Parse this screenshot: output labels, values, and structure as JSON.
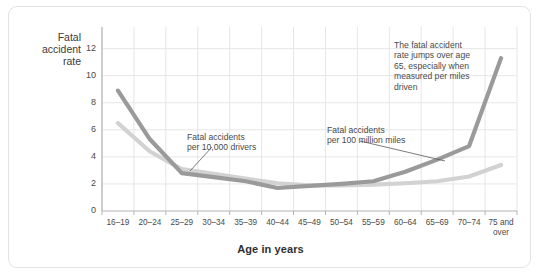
{
  "chart_data": {
    "type": "line",
    "title": "",
    "xlabel": "Age in years",
    "ylabel": "Fatal accident rate",
    "ylabel_lines": [
      "Fatal",
      "accident",
      "rate"
    ],
    "categories": [
      "16–19",
      "20–24",
      "25–29",
      "30–34",
      "35–39",
      "40–44",
      "45–49",
      "50–54",
      "55–59",
      "60–64",
      "65–69",
      "70–74",
      "75 and over"
    ],
    "yticks": [
      0,
      2,
      4,
      6,
      8,
      10,
      12
    ],
    "ylim": [
      0,
      13.6
    ],
    "grid": true,
    "legend_position": "inline-annotations",
    "series": [
      {
        "name": "Fatal accidents per 100 million miles",
        "color": "#9a9a9a",
        "values": [
          8.9,
          5.3,
          2.8,
          2.5,
          2.2,
          1.7,
          1.85,
          2.0,
          2.2,
          2.9,
          3.8,
          4.8,
          11.3
        ]
      },
      {
        "name": "Fatal accidents per 10,000 drivers",
        "color": "#d2d2d2",
        "values": [
          6.5,
          4.4,
          3.1,
          2.75,
          2.4,
          2.05,
          1.9,
          1.9,
          1.95,
          2.05,
          2.2,
          2.55,
          3.4
        ]
      }
    ],
    "annotations": [
      {
        "id": "annot-drivers",
        "lines": [
          "Fatal accidents",
          "per 10,000 drivers"
        ],
        "leader": true
      },
      {
        "id": "annot-miles",
        "lines": [
          "Fatal accidents",
          "per 100 million miles"
        ],
        "leader": true
      },
      {
        "id": "annot-note",
        "lines": [
          "The fatal accident",
          "rate jumps over age",
          "65, especially when",
          "measured per miles",
          "driven"
        ],
        "leader": false
      }
    ]
  },
  "colors": {
    "dark_series": "#9a9a9a",
    "light_series": "#d2d2d2",
    "grid": "#e6e6e6",
    "axis": "#b4b4b4",
    "text": "#4a4a4a",
    "card_border": "#e3e3e3",
    "background": "#ffffff"
  }
}
